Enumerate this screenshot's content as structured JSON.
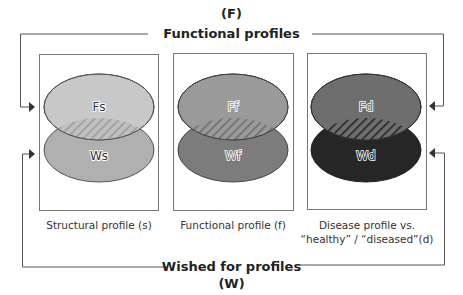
{
  "top_title": {
    "letter": "(F)",
    "label": "Functional profiles"
  },
  "bottom_title": {
    "label": "Wished for profiles",
    "letter": "(W)"
  },
  "panels": [
    {
      "id": "structural",
      "top_label": "Fs",
      "bottom_label": "Ws",
      "top_color": "#c8c8c8",
      "bottom_color": "#b0b0b0",
      "caption_line1": "Structural profile (s)",
      "caption_line2": ""
    },
    {
      "id": "functional",
      "top_label": "Ff",
      "bottom_label": "Wf",
      "top_color": "#9a9a9a",
      "bottom_color": "#7c7c7c",
      "caption_line1": "Functional profile (f)",
      "caption_line2": ""
    },
    {
      "id": "disease",
      "top_label": "Fd",
      "bottom_label": "Wd",
      "top_color": "#6e6e6e",
      "bottom_color": "#262626",
      "caption_line1": "Disease profile vs.",
      "caption_line2": "“healthy” / “diseased”(d)"
    }
  ],
  "colors": {
    "line": "#555555",
    "box": "#777777",
    "hatch": "#8a8a8a"
  }
}
